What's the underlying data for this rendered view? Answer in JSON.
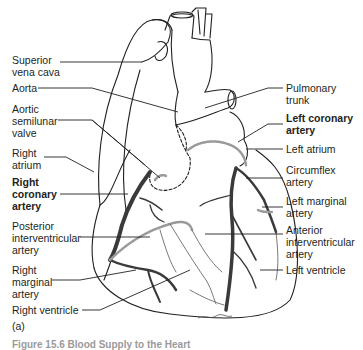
{
  "figure": {
    "panel_label": "(a)",
    "caption": "Figure 15.6   Blood Supply to the Heart"
  },
  "labels_left": [
    {
      "id": "superior-vena-cava",
      "lines": [
        "Superior",
        "vena cava"
      ],
      "bold": false
    },
    {
      "id": "aorta",
      "lines": [
        "Aorta"
      ],
      "bold": false
    },
    {
      "id": "aortic-semilunar-valve",
      "lines": [
        "Aortic",
        "semilunar",
        "valve"
      ],
      "bold": false
    },
    {
      "id": "right-atrium",
      "lines": [
        "Right",
        "atrium"
      ],
      "bold": false
    },
    {
      "id": "right-coronary-artery",
      "lines": [
        "Right",
        "coronary",
        "artery"
      ],
      "bold": true
    },
    {
      "id": "posterior-interventricular-artery",
      "lines": [
        "Posterior",
        "interventricular",
        "artery"
      ],
      "bold": false
    },
    {
      "id": "right-marginal-artery",
      "lines": [
        "Right",
        "marginal",
        "artery"
      ],
      "bold": false
    },
    {
      "id": "right-ventricle",
      "lines": [
        "Right ventricle"
      ],
      "bold": false
    }
  ],
  "labels_right": [
    {
      "id": "pulmonary-trunk",
      "lines": [
        "Pulmonary",
        "trunk"
      ],
      "bold": false
    },
    {
      "id": "left-coronary-artery",
      "lines": [
        "Left coronary",
        "artery"
      ],
      "bold": true
    },
    {
      "id": "left-atrium",
      "lines": [
        "Left atrium"
      ],
      "bold": false
    },
    {
      "id": "circumflex-artery",
      "lines": [
        "Circumflex",
        "artery"
      ],
      "bold": false
    },
    {
      "id": "left-marginal-artery",
      "lines": [
        "Left marginal",
        "artery"
      ],
      "bold": false
    },
    {
      "id": "anterior-interventricular-artery",
      "lines": [
        "Anterior",
        "interventricular",
        "artery"
      ],
      "bold": false
    },
    {
      "id": "left-ventricle",
      "lines": [
        "Left ventricle"
      ],
      "bold": false
    }
  ],
  "colors": {
    "outline": "#231f20",
    "artery": "#3a3a3a",
    "vein_dotted": "#9a9a9a",
    "leader_line": "#231f20"
  }
}
